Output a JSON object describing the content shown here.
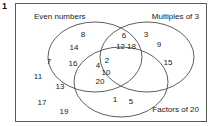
{
  "question": {
    "number": "1"
  },
  "diagram": {
    "type": "venn-3-set",
    "labels": {
      "set_a": "Even numbers",
      "set_b": "Multiples of 3",
      "set_c": "Factors of 20"
    },
    "regions": {
      "only_a": [
        "8",
        "14",
        "16"
      ],
      "only_b": [
        "3",
        "9",
        "15"
      ],
      "only_c": [
        "1",
        "5"
      ],
      "a_and_b": [
        "6",
        "12",
        "18"
      ],
      "a_and_c": [
        "4",
        "10",
        "20"
      ],
      "b_and_c": [],
      "a_b_c": [
        "2"
      ],
      "outside": [
        "7",
        "11",
        "13",
        "17",
        "19"
      ]
    },
    "colors": {
      "stroke": "#4d4d4d",
      "frame": "#5a5a5a",
      "text": "#1a1a1a",
      "background": "#ffffff"
    },
    "placements": [
      {
        "name": "num-8",
        "value": "8",
        "x": 67,
        "y": 31,
        "region": "only_a"
      },
      {
        "name": "num-14",
        "value": "14",
        "x": 58,
        "y": 44,
        "region": "only_a"
      },
      {
        "name": "num-16",
        "value": "16",
        "x": 57,
        "y": 60,
        "region": "only_a"
      },
      {
        "name": "num-6",
        "value": "6",
        "x": 108,
        "y": 32,
        "region": "a_and_b"
      },
      {
        "name": "num-12-18",
        "value": "12 18",
        "x": 110,
        "y": 43,
        "region": "a_and_b"
      },
      {
        "name": "num-3",
        "value": "3",
        "x": 130,
        "y": 31,
        "region": "only_b"
      },
      {
        "name": "num-9",
        "value": "9",
        "x": 143,
        "y": 41,
        "region": "only_b"
      },
      {
        "name": "num-15",
        "value": "15",
        "x": 152,
        "y": 59,
        "region": "only_b"
      },
      {
        "name": "num-2",
        "value": "2",
        "x": 91,
        "y": 57,
        "region": "a_b_c"
      },
      {
        "name": "num-4",
        "value": "4",
        "x": 82,
        "y": 62,
        "region": "a_and_c"
      },
      {
        "name": "num-10",
        "value": "10",
        "x": 90,
        "y": 69,
        "region": "a_and_c"
      },
      {
        "name": "num-20",
        "value": "20",
        "x": 84,
        "y": 78,
        "region": "a_and_c"
      },
      {
        "name": "num-1",
        "value": "1",
        "x": 99,
        "y": 96,
        "region": "only_c"
      },
      {
        "name": "num-5",
        "value": "5",
        "x": 115,
        "y": 98,
        "region": "only_c"
      },
      {
        "name": "num-7",
        "value": "7",
        "x": 33,
        "y": 58,
        "region": "outside"
      },
      {
        "name": "num-11",
        "value": "11",
        "x": 22,
        "y": 73,
        "region": "outside"
      },
      {
        "name": "num-13",
        "value": "13",
        "x": 44,
        "y": 83,
        "region": "outside"
      },
      {
        "name": "num-17",
        "value": "17",
        "x": 26,
        "y": 99,
        "region": "outside"
      },
      {
        "name": "num-19",
        "value": "19",
        "x": 48,
        "y": 108,
        "region": "outside"
      }
    ]
  }
}
